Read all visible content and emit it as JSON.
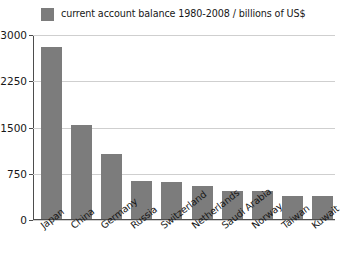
{
  "chart_data": {
    "type": "bar",
    "title": "",
    "subtitle": "",
    "xlabel": "",
    "ylabel": "",
    "categories": [
      "Japan",
      "China",
      "Germany",
      "Russia",
      "Switzerland",
      "Netherlands",
      "Saudi Arabia",
      "Norway",
      "Taiwan",
      "Kuwait"
    ],
    "values": [
      2790,
      1520,
      1050,
      620,
      600,
      530,
      460,
      455,
      380,
      370
    ],
    "series": [
      {
        "name": "current account balance 1980-2008 / billions of US$",
        "values": [
          2790,
          1520,
          1050,
          620,
          600,
          530,
          460,
          455,
          380,
          370
        ]
      }
    ],
    "ylim": [
      0,
      3000
    ],
    "yticks": [
      0,
      750,
      1500,
      2250,
      3000
    ],
    "ytick_labels": [
      "0",
      "750",
      "1500",
      "2250",
      "3000"
    ],
    "grid": true,
    "grid_axis": "y",
    "legend_position": "top-left",
    "bar_color": "#7c7c7c",
    "grid_color": "#cfcfcf",
    "axis_color": "#4d4d4d",
    "background": "#ffffff"
  },
  "legend": {
    "swatch_name": "legend-color-swatch",
    "label": "current account balance 1980-2008 / billions of US$"
  }
}
